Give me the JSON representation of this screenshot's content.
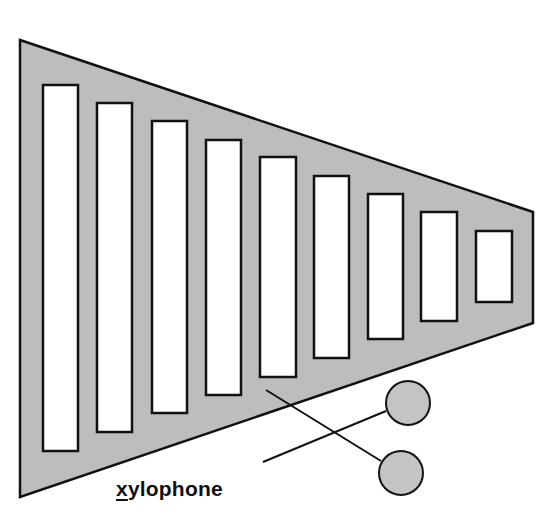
{
  "diagram": {
    "label": {
      "first_letter": "x",
      "rest": "ylophone",
      "full": "xylophone",
      "underlined_letter": "x"
    },
    "colors": {
      "body_fill": "#bdbdbd",
      "bar_fill": "#ffffff",
      "outline": "#111111",
      "mallet_fill": "#c4c4c4"
    },
    "frame": {
      "points": "20,40 533,212 533,323 20,497"
    },
    "bars": [
      {
        "x": 43,
        "y": 85,
        "w": 35,
        "h": 366
      },
      {
        "x": 97,
        "y": 103,
        "w": 35,
        "h": 329
      },
      {
        "x": 152,
        "y": 121,
        "w": 35,
        "h": 292
      },
      {
        "x": 206,
        "y": 140,
        "w": 35,
        "h": 255
      },
      {
        "x": 260,
        "y": 157,
        "w": 36,
        "h": 220
      },
      {
        "x": 314,
        "y": 176,
        "w": 35,
        "h": 182
      },
      {
        "x": 368,
        "y": 194,
        "w": 35,
        "h": 145
      },
      {
        "x": 421,
        "y": 212,
        "w": 36,
        "h": 109
      },
      {
        "x": 476,
        "y": 231,
        "w": 36,
        "h": 71
      }
    ],
    "mallets": [
      {
        "name": "upper-mallet",
        "stick": {
          "x1": 263,
          "y1": 462,
          "x2": 386,
          "y2": 411
        },
        "head": {
          "cx": 408,
          "cy": 403,
          "r": 22
        }
      },
      {
        "name": "lower-mallet",
        "stick": {
          "x1": 266,
          "y1": 390,
          "x2": 381,
          "y2": 461
        },
        "head": {
          "cx": 401,
          "cy": 473,
          "r": 22
        }
      }
    ]
  }
}
